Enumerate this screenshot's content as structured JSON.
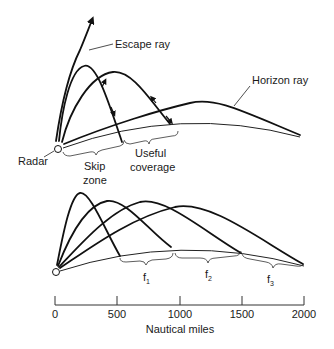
{
  "top_panel": {
    "labels": {
      "escape_ray": "Escape ray",
      "horizon_ray": "Horizon ray",
      "radar": "Radar",
      "skip_zone_line1": "Skip",
      "skip_zone_line2": "zone",
      "useful_line1": "Useful",
      "useful_line2": "coverage"
    }
  },
  "bottom_panel": {
    "frequency_labels": [
      {
        "base": "f",
        "sub": "1"
      },
      {
        "base": "f",
        "sub": "2"
      },
      {
        "base": "f",
        "sub": "3"
      }
    ]
  },
  "axis": {
    "ticks": [
      "0",
      "500",
      "1000",
      "1500",
      "2000"
    ],
    "label": "Nautical miles"
  },
  "colors": {
    "line": "#111111",
    "background": "#ffffff"
  }
}
